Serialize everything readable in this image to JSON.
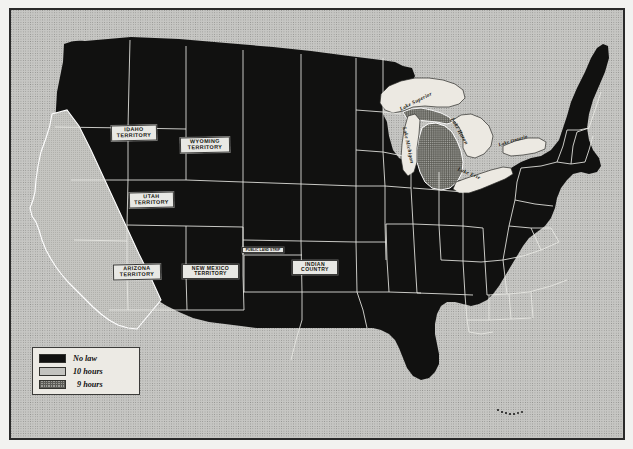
{
  "map": {
    "title": "United States map of hours-of-labor laws",
    "subject": "Maximum hours of labor laws by state and territory",
    "background_color": "#c6c6c3",
    "land_no_law_color": "#111110",
    "land_10_hours_color": "#c3c3bf",
    "land_9_hours_color": "#9c9c97",
    "border_color": "#2a2a2a"
  },
  "legend": {
    "name": "map-legend",
    "items": [
      {
        "label": "No law",
        "pattern": "solid-black",
        "color": "#111110"
      },
      {
        "label": "10 hours",
        "pattern": "light-stipple",
        "color": "#c3c3bf"
      },
      {
        "label": "9 hours",
        "pattern": "cross-hatch",
        "color": "#9c9c97"
      }
    ]
  },
  "territory_labels": [
    {
      "id": "idaho",
      "text": "IDAHO\nTERRITORY",
      "x": 109,
      "y": 123,
      "w": 46,
      "h": 16
    },
    {
      "id": "wyoming",
      "text": "WYOMING\nTERRITORY",
      "x": 177,
      "y": 135,
      "w": 50,
      "h": 16
    },
    {
      "id": "utah",
      "text": "UTAH\nTERRITORY",
      "x": 127,
      "y": 190,
      "w": 45,
      "h": 16
    },
    {
      "id": "arizona",
      "text": "ARIZONA\nTERRITORY",
      "x": 111,
      "y": 262,
      "w": 48,
      "h": 16
    },
    {
      "id": "new-mexico",
      "text": "NEW MEXICO\nTERRITORY",
      "x": 180,
      "y": 262,
      "w": 56,
      "h": 16
    },
    {
      "id": "indian",
      "text": "INDIAN\nCOUNTRY",
      "x": 290,
      "y": 258,
      "w": 45,
      "h": 16
    },
    {
      "id": "public-land-strip",
      "text": "PUBLIC LAND STRIP",
      "x": 240,
      "y": 245,
      "w": 41,
      "h": 7
    }
  ],
  "lake_labels": [
    {
      "id": "lake-superior",
      "text": "Lake Superior",
      "x": 398,
      "y": 98,
      "rotate": -26
    },
    {
      "id": "lake-michigan",
      "text": "Lake Michigan",
      "x": 409,
      "y": 133,
      "rotate": 76
    },
    {
      "id": "lake-huron",
      "text": "Lake Huron",
      "x": 452,
      "y": 119,
      "rotate": 58
    },
    {
      "id": "lake-erie",
      "text": "Lake Erie",
      "x": 468,
      "y": 160,
      "rotate": 23
    },
    {
      "id": "lake-ontario",
      "text": "Lake Ontario",
      "x": 498,
      "y": 130,
      "rotate": -16
    }
  ],
  "regions": {
    "ten_hours": [
      "California"
    ],
    "nine_hours": [
      "Michigan"
    ],
    "no_law": [
      "all other states and territories"
    ]
  }
}
